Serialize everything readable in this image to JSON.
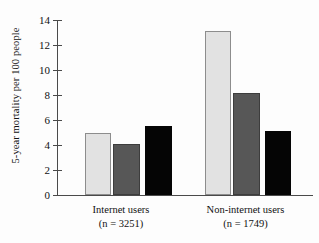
{
  "chart_data": {
    "type": "bar",
    "title": "",
    "xlabel": "",
    "ylabel": "5-year mortality per 100 people",
    "categories": [
      "Internet users",
      "Non-internet users"
    ],
    "category_sublabels": [
      "(n = 3251)",
      "(n = 1749)"
    ],
    "ylim": [
      0,
      14
    ],
    "yticks": [
      0,
      2,
      4,
      6,
      8,
      10,
      12,
      14
    ],
    "ytick_labels": [
      "0",
      "2",
      "4",
      "6",
      "8",
      "10",
      "12",
      "14"
    ],
    "grid": false,
    "legend": "none",
    "series": [
      {
        "name": "series-1",
        "style": "light-gray",
        "color": "#e2e2e2",
        "values": [
          5.0,
          13.1
        ]
      },
      {
        "name": "series-2",
        "style": "dark-gray",
        "color": "#575757",
        "values": [
          4.1,
          8.2
        ]
      },
      {
        "name": "series-3",
        "style": "black",
        "color": "#050505",
        "values": [
          5.5,
          5.1
        ]
      }
    ]
  },
  "axis": {
    "y_title": "5-year mortality per 100 people",
    "ticks": [
      {
        "value": 14,
        "label": "14"
      },
      {
        "value": 12,
        "label": "12"
      },
      {
        "value": 10,
        "label": "10"
      },
      {
        "value": 8,
        "label": "8"
      },
      {
        "value": 6,
        "label": "6"
      },
      {
        "value": 4,
        "label": "4"
      },
      {
        "value": 2,
        "label": "2"
      },
      {
        "value": 0,
        "label": "0"
      }
    ]
  },
  "groups": [
    {
      "label": "Internet users",
      "sublabel": "(n = 3251)"
    },
    {
      "label": "Non-internet users",
      "sublabel": "(n = 1749)"
    }
  ]
}
